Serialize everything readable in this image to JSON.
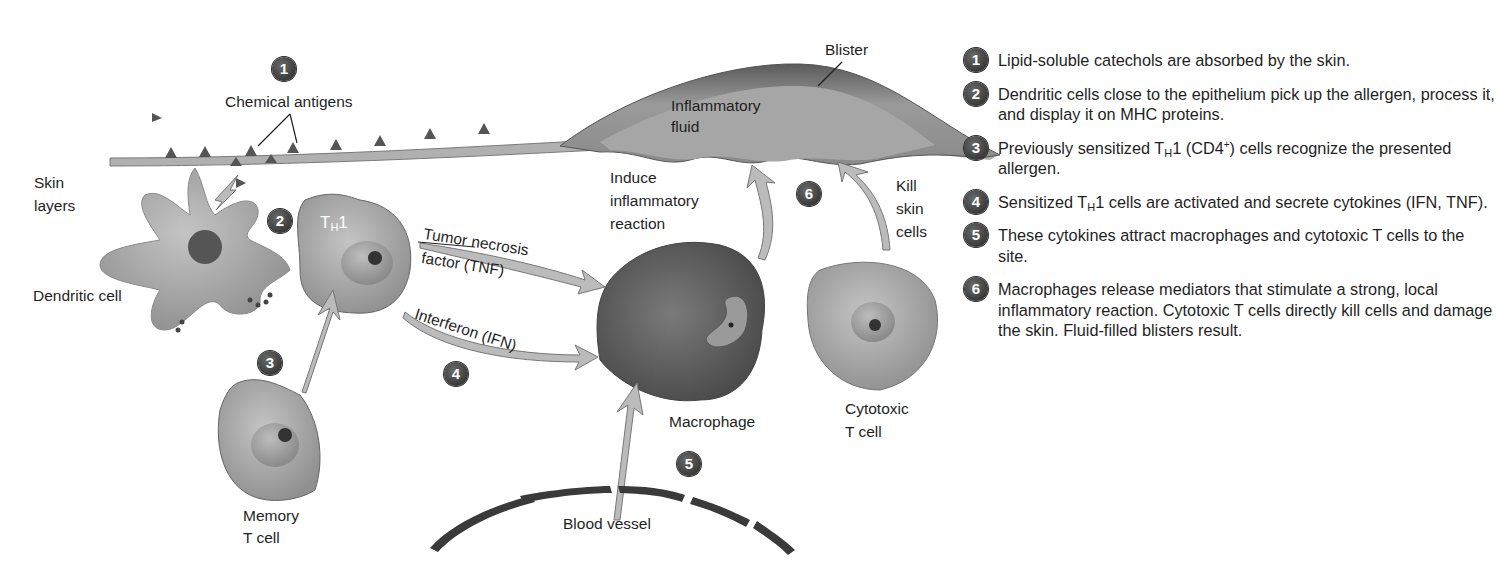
{
  "figure": {
    "labels": {
      "chemical_antigens": "Chemical antigens",
      "skin_layers_1": "Skin",
      "skin_layers_2": "layers",
      "dendritic_cell": "Dendritic cell",
      "th1_t": "T",
      "th1_sub": "H",
      "th1_num": "1",
      "tnf_1": "Tumor necrosis",
      "tnf_2": "factor (TNF)",
      "ifn": "Interferon (IFN)",
      "memory_1": "Memory",
      "memory_2": "T cell",
      "blister": "Blister",
      "inflammatory_1": "Inflammatory",
      "inflammatory_2": "fluid",
      "induce_1": "Induce",
      "induce_2": "inflammatory",
      "induce_3": "reaction",
      "kill_1": "Kill",
      "kill_2": "skin",
      "kill_3": "cells",
      "macrophage": "Macrophage",
      "cytotoxic_1": "Cytotoxic",
      "cytotoxic_2": "T cell",
      "blood_vessel": "Blood vessel"
    },
    "badges": [
      "1",
      "2",
      "3",
      "4",
      "5",
      "6"
    ]
  },
  "steps": [
    {
      "num": "1",
      "text": "Lipid-soluble catechols are absorbed by the skin."
    },
    {
      "num": "2",
      "text": "Dendritic cells close to the epithelium pick up the allergen, process it, and display it on MHC proteins."
    },
    {
      "num": "3",
      "pre": "Previously sensitized T",
      "sub": "H",
      "mid": "1 (CD4",
      "sup": "+",
      "post": ") cells recognize the presented allergen."
    },
    {
      "num": "4",
      "pre": "Sensitized T",
      "sub": "H",
      "post": "1 cells are activated and secrete cytokines (IFN, TNF)."
    },
    {
      "num": "5",
      "text": "These cytokines attract macrophages and cytotoxic T cells to the site."
    },
    {
      "num": "6",
      "text": "Macrophages release mediators that stimulate a strong, local inflammatory reaction. Cytotoxic T cells directly kill cells and damage the skin. Fluid-filled blisters result."
    }
  ]
}
